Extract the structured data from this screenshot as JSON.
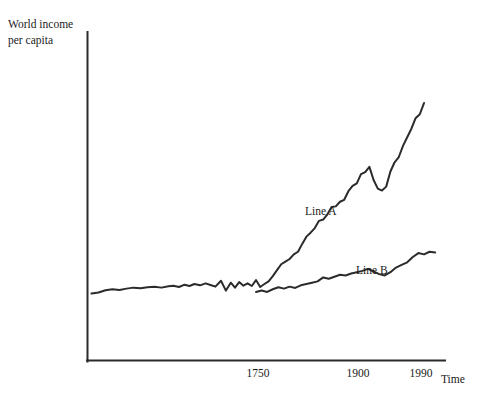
{
  "figure": {
    "background_color": "#ffffff",
    "line_color": "#2b2b2b",
    "text_color": "#1a1a1a"
  },
  "axes": {
    "y_axis_title_line1": "World income",
    "y_axis_title_line2": "per capita",
    "x_axis_title": "Time",
    "x_tick_labels": [
      "1750",
      "1900",
      "1990"
    ]
  },
  "labels": {
    "line_a": "Line A",
    "line_b": "Line B"
  },
  "chart_data": {
    "type": "line",
    "title": "",
    "xlabel": "Time",
    "ylabel": "World income per capita",
    "grid": false,
    "legend": "inline-annotations",
    "xlim": [
      1500,
      2010
    ],
    "ylim": [
      0,
      100
    ],
    "x_ticks": [
      1750,
      1900,
      1990
    ],
    "x_tick_labels": [
      "1750",
      "1900",
      "1990"
    ],
    "y_ticks": [],
    "y_tick_labels": [],
    "annotations": [
      {
        "text": "Line A",
        "x": 1838,
        "y": 50
      },
      {
        "text": "Line B",
        "x": 1905,
        "y": 33
      }
    ],
    "series": [
      {
        "name": "Line A",
        "label_position": "above-curve-left",
        "x": [
          1505,
          1515,
          1525,
          1535,
          1545,
          1555,
          1565,
          1575,
          1585,
          1595,
          1605,
          1615,
          1622,
          1630,
          1638,
          1645,
          1652,
          1660,
          1668,
          1675,
          1682,
          1690,
          1697,
          1704,
          1710,
          1716,
          1722,
          1728,
          1734,
          1740,
          1746,
          1752,
          1758,
          1764,
          1770,
          1776,
          1782,
          1788,
          1794,
          1800,
          1806,
          1812,
          1818,
          1824,
          1830,
          1836,
          1842,
          1848,
          1854,
          1860,
          1866,
          1872,
          1878,
          1884,
          1890,
          1896,
          1902,
          1908,
          1914,
          1920,
          1926,
          1932,
          1938,
          1944,
          1950,
          1956,
          1962,
          1968,
          1974,
          1980
        ],
        "y": [
          20.5,
          20.8,
          21.5,
          21.8,
          21.6,
          22.0,
          22.3,
          22.1,
          22.4,
          22.6,
          22.3,
          22.7,
          22.9,
          22.5,
          23.2,
          22.8,
          23.4,
          23.0,
          23.6,
          23.1,
          22.6,
          24.4,
          21.4,
          23.8,
          22.3,
          24.0,
          22.9,
          23.6,
          22.8,
          24.6,
          22.5,
          23.4,
          24.2,
          25.8,
          27.6,
          29.4,
          30.2,
          31.0,
          32.4,
          33.2,
          35.6,
          37.8,
          39.0,
          40.4,
          42.6,
          43.0,
          44.6,
          46.8,
          47.0,
          48.4,
          49.0,
          51.6,
          53.2,
          54.0,
          56.8,
          57.4,
          59.0,
          55.0,
          52.4,
          51.8,
          53.0,
          57.6,
          60.4,
          62.0,
          65.4,
          68.0,
          70.6,
          73.8,
          75.0,
          78.4
        ]
      },
      {
        "name": "Line B",
        "label_position": "above-curve-right",
        "x": [
          1740,
          1748,
          1756,
          1764,
          1772,
          1780,
          1788,
          1796,
          1804,
          1812,
          1820,
          1828,
          1836,
          1844,
          1852,
          1860,
          1868,
          1876,
          1884,
          1892,
          1900,
          1908,
          1916,
          1924,
          1932,
          1940,
          1948,
          1956,
          1964,
          1972,
          1980,
          1988,
          1996
        ],
        "y": [
          21.0,
          21.4,
          21.0,
          21.8,
          22.4,
          22.0,
          22.6,
          22.2,
          23.0,
          23.4,
          23.8,
          24.2,
          25.4,
          25.0,
          25.6,
          26.2,
          26.0,
          26.6,
          27.0,
          27.4,
          28.0,
          27.2,
          26.4,
          26.0,
          27.0,
          28.4,
          29.2,
          30.0,
          31.6,
          32.8,
          32.4,
          33.2,
          33.0
        ]
      }
    ]
  }
}
